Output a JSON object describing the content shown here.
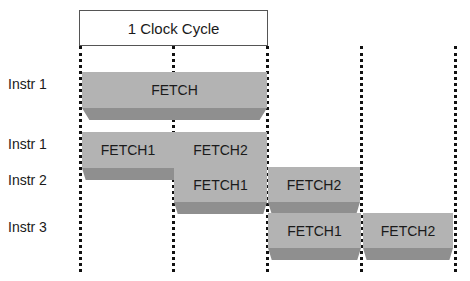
{
  "header": {
    "clock_label": "1 Clock Cycle"
  },
  "colors": {
    "block_face": "#b3b3b3",
    "block_bevel": "#8f8f8f",
    "grid_line": "#111111"
  },
  "rows": [
    {
      "label": "Instr 1"
    },
    {
      "label": "Instr 1"
    },
    {
      "label": "Instr 2"
    },
    {
      "label": "Instr 3"
    }
  ],
  "blocks": [
    {
      "label": "FETCH"
    },
    {
      "label": "FETCH1"
    },
    {
      "label": "FETCH2"
    },
    {
      "label": "FETCH1"
    },
    {
      "label": "FETCH2"
    },
    {
      "label": "FETCH1"
    },
    {
      "label": "FETCH2"
    }
  ]
}
